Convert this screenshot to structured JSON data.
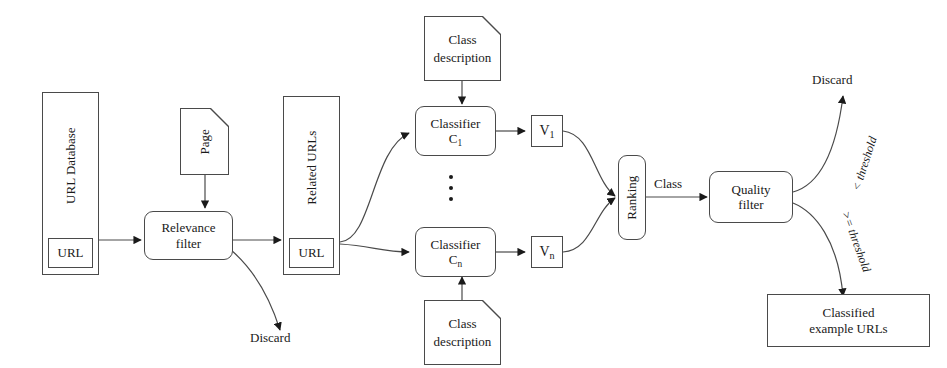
{
  "diagram": {
    "stroke_color": "#4a4a4a",
    "text_color": "#1a1a1a",
    "background": "#ffffff"
  },
  "nodes": {
    "url_database": {
      "name": "URL Database",
      "slot": "URL"
    },
    "page": {
      "name": "Page"
    },
    "relevance_filter": {
      "line1": "Relevance",
      "line2": "filter"
    },
    "related_urls": {
      "name": "Related URLs",
      "slot": "URL"
    },
    "class_description_top": {
      "line1": "Class",
      "line2": "description"
    },
    "class_description_bottom": {
      "line1": "Class",
      "line2": "description"
    },
    "classifier_first": {
      "line1": "Classifier",
      "line2": "C",
      "subscript": "1"
    },
    "classifier_last": {
      "line1": "Classifier",
      "line2": "C",
      "subscript": "n"
    },
    "vote_first": {
      "symbol": "V",
      "subscript": "1"
    },
    "vote_last": {
      "symbol": "V",
      "subscript": "n"
    },
    "ranking": {
      "name": "Ranking"
    },
    "quality_filter": {
      "line1": "Quality",
      "line2": "filter"
    },
    "classified_urls": {
      "line1": "Classified",
      "line2": "example URLs"
    }
  },
  "edge_labels": {
    "discard_left": "Discard",
    "discard_right": "Discard",
    "class": "Class",
    "below_threshold": "< threshold",
    "at_or_above_threshold": ">= threshold"
  },
  "ellipsis": {
    "dot_count": 3,
    "meaning": "additional classifiers C2 through Cn-1"
  }
}
